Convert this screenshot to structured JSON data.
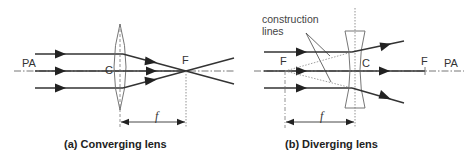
{
  "figure": {
    "panel_a": {
      "caption": "(a) Converging lens",
      "axis_label": "PA",
      "center_label": "C",
      "focus_label": "F",
      "focal_length_label": "f",
      "lens_type": "convex"
    },
    "panel_b": {
      "caption": "(b) Diverging lens",
      "axis_label": "PA",
      "center_label": "C",
      "focus_left_label": "F",
      "focus_right_label": "F",
      "focal_length_label": "f",
      "annotation_line1": "construction",
      "annotation_line2": "lines",
      "lens_type": "concave"
    },
    "colors": {
      "ray": "#333333",
      "axis": "#555555",
      "lens": "#666666",
      "construction": "#888888",
      "background": "#ffffff"
    }
  }
}
